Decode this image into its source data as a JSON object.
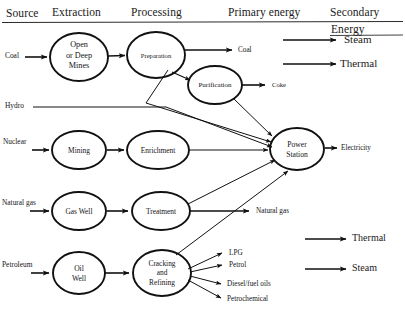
{
  "diagram": {
    "title_columns": [
      {
        "label": "Source",
        "x": 6,
        "y": 8
      },
      {
        "label": "Extraction",
        "x": 52,
        "y": 7
      },
      {
        "label": "Processing",
        "x": 131,
        "y": 7
      },
      {
        "label": "Primary energy",
        "x": 228,
        "y": 7
      },
      {
        "label": "Secondary",
        "x": 330,
        "y": 7
      },
      {
        "label": "Energy",
        "x": 331,
        "y": 24
      }
    ],
    "sources": [
      {
        "label": "Coal",
        "x": 5,
        "y": 41
      },
      {
        "label": "Hydro",
        "x": 5,
        "y": 104
      },
      {
        "label": "Nuclear",
        "x": 4,
        "y": 139
      },
      {
        "label": "Natural gas",
        "x": 3,
        "y": 195
      },
      {
        "label": "Petroleum",
        "x": 3,
        "y": 258
      }
    ],
    "nodes": [
      {
        "id": "mines",
        "lines": [
          "Open",
          "or Deep",
          "Mines"
        ],
        "cx": 79,
        "cy": 57,
        "rx": 29,
        "ry": 24,
        "font": 8.2
      },
      {
        "id": "preparation",
        "lines": [
          "Preparation"
        ],
        "cx": 156,
        "cy": 55,
        "rx": 29,
        "ry": 23,
        "font": 6.6
      },
      {
        "id": "purification",
        "lines": [
          "Purification"
        ],
        "cx": 215,
        "cy": 85,
        "rx": 27,
        "ry": 19,
        "font": 7.0
      },
      {
        "id": "mining",
        "lines": [
          "Mining"
        ],
        "cx": 79,
        "cy": 150,
        "rx": 27,
        "ry": 19,
        "font": 7.4
      },
      {
        "id": "enrichment",
        "lines": [
          "Enrichment"
        ],
        "cx": 158,
        "cy": 150,
        "rx": 31,
        "ry": 19,
        "font": 7.4
      },
      {
        "id": "power-station",
        "lines": [
          "Power",
          "Station"
        ],
        "cx": 297,
        "cy": 149,
        "rx": 27,
        "ry": 21,
        "font": 7.6
      },
      {
        "id": "gas-well",
        "lines": [
          "Gas Well"
        ],
        "cx": 79,
        "cy": 211,
        "rx": 27,
        "ry": 19,
        "font": 7.4
      },
      {
        "id": "treatment",
        "lines": [
          "Treatment"
        ],
        "cx": 161,
        "cy": 211,
        "rx": 29,
        "ry": 19,
        "font": 7.4
      },
      {
        "id": "oil-well",
        "lines": [
          "Oil",
          "Well"
        ],
        "cx": 79,
        "cy": 273,
        "rx": 26,
        "ry": 21,
        "font": 7.6
      },
      {
        "id": "cracking",
        "lines": [
          "Cracking",
          "and",
          "Refining"
        ],
        "cx": 162,
        "cy": 273,
        "rx": 29,
        "ry": 23,
        "font": 7.4
      }
    ],
    "outputs": [
      {
        "label": "Coal",
        "x": 238,
        "y": 50
      },
      {
        "label": "Coke",
        "x": 272,
        "y": 84
      },
      {
        "label": "Electricity",
        "x": 341,
        "y": 146
      },
      {
        "label": "Natural gas",
        "x": 256,
        "y": 207
      },
      {
        "label": "LPG",
        "x": 230,
        "y": 254
      },
      {
        "label": "Petrol",
        "x": 230,
        "y": 266
      },
      {
        "label": "Diesel/fuel oils",
        "x": 228,
        "y": 285
      },
      {
        "label": "Petrochemical",
        "x": 228,
        "y": 300
      }
    ],
    "secondary_outputs": [
      {
        "label": "Steam",
        "x": 344,
        "y": 36
      },
      {
        "label": "Thermal",
        "x": 340,
        "y": 60
      }
    ],
    "legend": [
      {
        "label": "Thermal",
        "x": 352,
        "y": 235
      },
      {
        "label": "Steam",
        "x": 352,
        "y": 265
      }
    ],
    "colors": {
      "stroke": "#111111",
      "background": "#ffffff",
      "text": "#141414",
      "rule": "#2b2b2b"
    }
  }
}
